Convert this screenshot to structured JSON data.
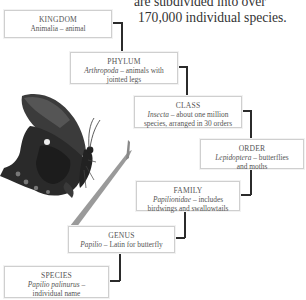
{
  "intro": {
    "line1": "are subdivided into over",
    "line2": "170,000 individual species."
  },
  "taxonomy": [
    {
      "rank": "KINGDOM",
      "latin": "Animalia",
      "desc_l1": " – animal",
      "desc_l2": ""
    },
    {
      "rank": "PHYLUM",
      "latin": "Arthropoda",
      "desc_l1": " – animals with",
      "desc_l2": "jointed legs"
    },
    {
      "rank": "CLASS",
      "latin": "Insecta",
      "desc_l1": " – about one million",
      "desc_l2": "species, arranged in 30 orders"
    },
    {
      "rank": "ORDER",
      "latin": "Lepidoptera",
      "desc_l1": " – butterflies",
      "desc_l2": "and moths"
    },
    {
      "rank": "FAMILY",
      "latin": "Papilionidae",
      "desc_l1": " – includes",
      "desc_l2": "birdwings and swallowtails"
    },
    {
      "rank": "GENUS",
      "latin": "Papilio",
      "desc_l1": " – Latin for butterfly",
      "desc_l2": ""
    },
    {
      "rank": "SPECIES",
      "latin": "Papilio palinurus",
      "desc_l1": " –",
      "desc_l2": "individual name"
    }
  ],
  "illustration": {
    "subject": "swallowtail butterfly on grass stem"
  },
  "colors": {
    "connector": "#2b2b2b",
    "box_border": "#cfcfcf",
    "text": "#555555"
  }
}
